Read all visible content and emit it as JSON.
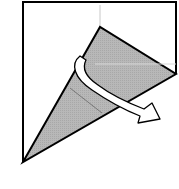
{
  "diagram": {
    "title": "",
    "type": "origami-fold-step",
    "colors": {
      "paper_front": "#ffffff",
      "paper_back": "#b3b3b3",
      "outline": "#000000",
      "crease": "#cccccc",
      "arrow_fill": "#ffffff"
    },
    "elements": [
      {
        "name": "paper-square",
        "kind": "outline"
      },
      {
        "name": "folded-cone",
        "kind": "shaded-flap"
      },
      {
        "name": "crease-line-vertical",
        "kind": "crease"
      },
      {
        "name": "crease-line-diagonal",
        "kind": "crease"
      },
      {
        "name": "turn-over-arrow",
        "kind": "arrow",
        "meaning": "fold / wrap around"
      }
    ]
  }
}
